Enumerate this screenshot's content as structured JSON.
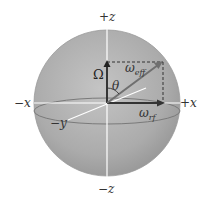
{
  "diagram": {
    "type": "bloch-sphere",
    "axes": {
      "plus_z": "+z",
      "minus_z": "−z",
      "plus_x": "+x",
      "minus_x": "−x",
      "minus_y": "−y"
    },
    "vectors": {
      "omega_big": "Ω",
      "omega_eff_base": "ω",
      "omega_eff_sub": "eff",
      "omega_rf_base": "ω",
      "omega_rf_sub": "rf"
    },
    "angle": "θ",
    "colors": {
      "sphere": "#a8a8a8",
      "sphere_edge": "#8a8a8a",
      "axis_line": "#ffffff",
      "vector": "#333333",
      "eff_vector": "#777777"
    }
  }
}
